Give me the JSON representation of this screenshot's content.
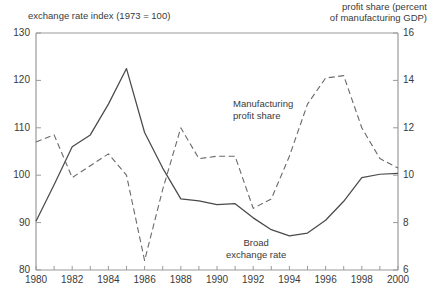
{
  "axes": {
    "left_title": "exchange rate index (1973 = 100)",
    "right_title": "profit share (percent\nof manufacturing GDP)",
    "left_ticks": [
      "130",
      "120",
      "110",
      "100",
      "90",
      "80"
    ],
    "right_ticks": [
      "16",
      "14",
      "12",
      "10",
      "8",
      "6"
    ],
    "x_ticks": [
      "1980",
      "1982",
      "1984",
      "1986",
      "1988",
      "1990",
      "1992",
      "1994",
      "1996",
      "1998",
      "2000"
    ]
  },
  "annotations": {
    "profit_share": "Manufacturing\nprofit share",
    "exchange_rate": "Broad\nexchange rate"
  },
  "colors": {
    "line": "#4a4a4a",
    "axis": "#8c8c8c",
    "text": "#3a3a3a",
    "background": "#ffffff"
  },
  "chart_data": {
    "type": "line",
    "title": "",
    "xlabel": "",
    "grid": false,
    "legend": "inline-annotations",
    "xlim": [
      1980,
      2000
    ],
    "x": [
      1980,
      1981,
      1982,
      1983,
      1984,
      1985,
      1986,
      1987,
      1988,
      1989,
      1990,
      1991,
      1992,
      1993,
      1994,
      1995,
      1996,
      1997,
      1998,
      1999,
      2000
    ],
    "series": [
      {
        "name": "Broad exchange rate",
        "axis": "left",
        "ylabel": "exchange rate index (1973 = 100)",
        "ylim": [
          80,
          130
        ],
        "yticks": [
          80,
          90,
          100,
          110,
          120,
          130
        ],
        "style": "solid",
        "values": [
          90.3,
          98.0,
          106.0,
          108.5,
          115.0,
          122.5,
          109.0,
          101.5,
          95.0,
          94.6,
          93.8,
          94.0,
          91.0,
          88.5,
          87.2,
          87.8,
          90.5,
          94.5,
          99.5,
          100.2,
          100.4
        ]
      },
      {
        "name": "Manufacturing profit share",
        "axis": "right",
        "ylabel": "profit share (percent of manufacturing GDP)",
        "ylim": [
          6,
          16
        ],
        "yticks": [
          6,
          8,
          10,
          12,
          14,
          16
        ],
        "style": "dashed",
        "values": [
          11.4,
          11.7,
          9.9,
          10.4,
          10.9,
          10.0,
          6.4,
          9.4,
          12.0,
          10.7,
          10.8,
          10.8,
          8.6,
          9.0,
          10.8,
          13.0,
          14.1,
          14.2,
          12.0,
          10.7,
          10.3
        ]
      }
    ]
  }
}
